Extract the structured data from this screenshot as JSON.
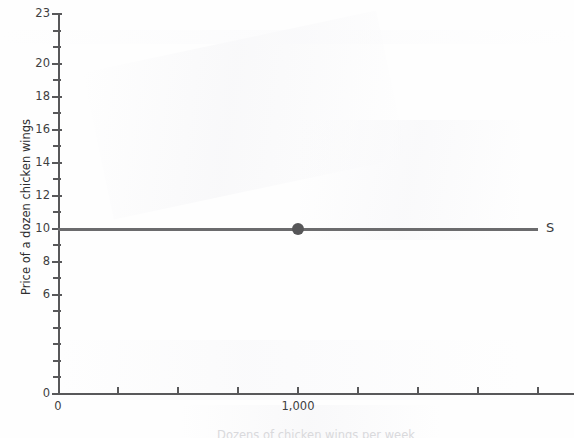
{
  "chart_data": {
    "type": "line",
    "title": "",
    "xlabel": "Dozens of chicken wings per week",
    "ylabel": "Price of a dozen chicken wings",
    "xlim": [
      0,
      2150
    ],
    "ylim": [
      0,
      23
    ],
    "grid": false,
    "legend": "none",
    "y_ticks_major": [
      0,
      6,
      8,
      10,
      12,
      14,
      16,
      18,
      20,
      23
    ],
    "y_tick_labels": [
      "0",
      "6",
      "8",
      "10",
      "12",
      "14",
      "16",
      "18",
      "20",
      "23"
    ],
    "y_ticks_minor_step": 1,
    "x_tick_labels": [
      "0",
      "1,000"
    ],
    "x_tick_values": [
      0,
      1000
    ],
    "x_tick_count": 9,
    "x_tick_step": 250,
    "series": [
      {
        "name": "S",
        "label": "S",
        "type": "horizontal-line",
        "description": "Perfectly elastic supply curve",
        "y_value": 10,
        "color": "#6b6b6d",
        "points": [
          {
            "x": 0,
            "y": 10
          },
          {
            "x": 2000,
            "y": 10
          }
        ]
      }
    ],
    "markers": [
      {
        "name": "equilibrium-point",
        "x": 1000,
        "y": 10,
        "label": "",
        "color": "#565658"
      }
    ],
    "annotations": [
      {
        "name": "supply-curve-label",
        "text": "S",
        "x": 2050,
        "y": 10
      }
    ]
  },
  "axes": {
    "y_title": "Price of a dozen chicken wings",
    "x_title": "Dozens of chicken wings per week",
    "origin_label_x": "0",
    "origin_label_y": "0"
  },
  "labels": {
    "supply": "S"
  },
  "colors": {
    "axis": "#58585a",
    "line": "#6b6b6d",
    "point": "#565658",
    "text": "#3f3f41",
    "background": "#fefefe"
  }
}
